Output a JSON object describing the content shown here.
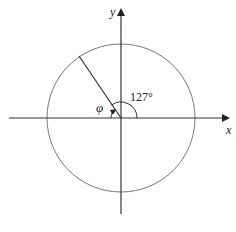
{
  "diagram": {
    "type": "unit-circle-angle",
    "axes": {
      "x_label": "x",
      "y_label": "y"
    },
    "angle": {
      "label": "127°",
      "degrees": 127
    },
    "reference_angle": {
      "label": "φ"
    },
    "colors": {
      "stroke": "#333333",
      "circle": "#777777",
      "text": "#222222"
    }
  }
}
